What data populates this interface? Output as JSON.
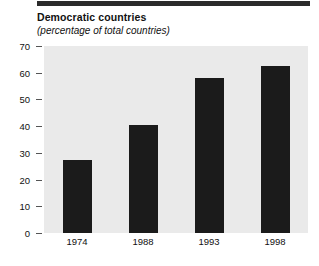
{
  "figure": {
    "title": "Democratic countries",
    "subtitle": "(percentage of total countries)",
    "rule_color": "#2b2b2b",
    "plot_background": "#eaeaea",
    "bar_color": "#1b1b1b"
  },
  "chart_data": {
    "type": "bar",
    "title": "Democratic countries",
    "subtitle": "(percentage of total countries)",
    "xlabel": "",
    "ylabel": "",
    "ylim": [
      0,
      70
    ],
    "yticks": [
      0,
      10,
      20,
      30,
      40,
      50,
      60,
      70
    ],
    "grid": false,
    "legend": false,
    "categories": [
      "1974",
      "1988",
      "1993",
      "1998"
    ],
    "values": [
      27.5,
      40.5,
      58,
      62.5
    ],
    "series": [
      {
        "name": "Democratic countries",
        "values": [
          27.5,
          40.5,
          58,
          62.5
        ]
      }
    ],
    "ytick_labels": [
      "0",
      "10",
      "20",
      "30",
      "40",
      "50",
      "60",
      "70"
    ],
    "xtick_labels": [
      "1974",
      "1988",
      "1993",
      "1998"
    ]
  }
}
